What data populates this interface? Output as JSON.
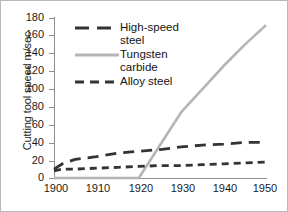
{
  "chart_data": {
    "type": "line",
    "title": "",
    "xlabel": "",
    "ylabel": "Cutting tool speed m/sec",
    "xlim": [
      1900,
      1950
    ],
    "ylim": [
      0,
      180
    ],
    "xticks": [
      1900,
      1910,
      1920,
      1930,
      1940,
      1950
    ],
    "yticks": [
      0,
      20,
      40,
      60,
      80,
      100,
      120,
      140,
      160,
      180
    ],
    "grid": false,
    "legend_position": "upper-left-inside",
    "series": [
      {
        "name": "High-speed steel",
        "legend_label": "High-speed\nsteel",
        "color": "#333333",
        "style": "long-dash",
        "x": [
          1900,
          1902,
          1905,
          1910,
          1915,
          1920,
          1925,
          1930,
          1935,
          1940,
          1945,
          1950
        ],
        "values": [
          10,
          16,
          21,
          24,
          28,
          30,
          32,
          35,
          37,
          38,
          40,
          40
        ]
      },
      {
        "name": "Tungsten carbide",
        "legend_label": "Tungsten\ncarbide",
        "color": "#b5b5b5",
        "style": "solid",
        "x": [
          1900,
          1910,
          1920,
          1930,
          1935,
          1940,
          1945,
          1950
        ],
        "values": [
          0,
          0,
          0,
          74,
          100,
          126,
          150,
          172
        ]
      },
      {
        "name": "Alloy steel",
        "legend_label": "Alloy steel",
        "color": "#333333",
        "style": "short-dash",
        "x": [
          1900,
          1902,
          1905,
          1910,
          1915,
          1920,
          1925,
          1930,
          1935,
          1940,
          1945,
          1950
        ],
        "values": [
          8,
          10,
          10,
          11,
          12,
          13,
          14,
          14,
          15,
          16,
          17,
          18
        ]
      }
    ]
  },
  "axes": {
    "y_title": "Cutting tool speed m/sec",
    "y_tick_labels": [
      "180",
      "160",
      "140",
      "120",
      "100",
      "80",
      "60",
      "40",
      "20",
      "0"
    ],
    "x_tick_labels": [
      "1900",
      "1910",
      "1920",
      "1930",
      "1940",
      "1950"
    ]
  },
  "legend": {
    "items": [
      {
        "label": "High-speed\nsteel",
        "swatch": "long-dash-swatch"
      },
      {
        "label": "Tungsten\ncarbide",
        "swatch": "solid-line-swatch"
      },
      {
        "label": "Alloy steel",
        "swatch": "short-dash-swatch"
      }
    ]
  }
}
